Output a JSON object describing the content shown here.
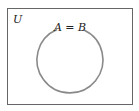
{
  "diagram": {
    "type": "venn",
    "universe_label": "U",
    "set_label": "A = B",
    "colors": {
      "frame": "#666666",
      "circle": "#8a8a8a",
      "text": "#222222",
      "background": "#ffffff"
    }
  }
}
